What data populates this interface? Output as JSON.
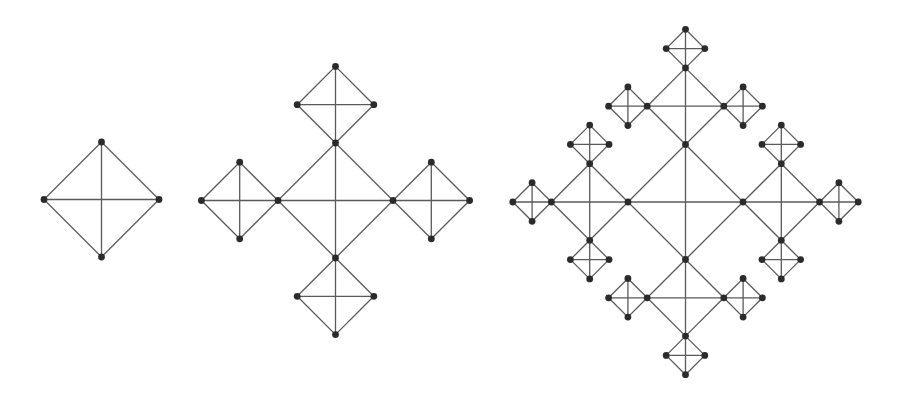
{
  "diagram": {
    "title": "",
    "colors": {
      "background": "#ffffff",
      "edge": "#5a5a5a",
      "node": "#2b2b2b"
    },
    "node_radius": 3.4,
    "figures": [
      {
        "id": "stage-1",
        "center": [
          101.5,
          199.5
        ],
        "sizes": [
          57.5
        ]
      },
      {
        "id": "stage-2",
        "center": [
          335.5,
          200.5
        ],
        "sizes": [
          57.5,
          38.3
        ]
      },
      {
        "id": "stage-3",
        "center": [
          685.5,
          202.0
        ],
        "sizes": [
          57.5,
          38.3,
          19.3
        ]
      }
    ]
  }
}
